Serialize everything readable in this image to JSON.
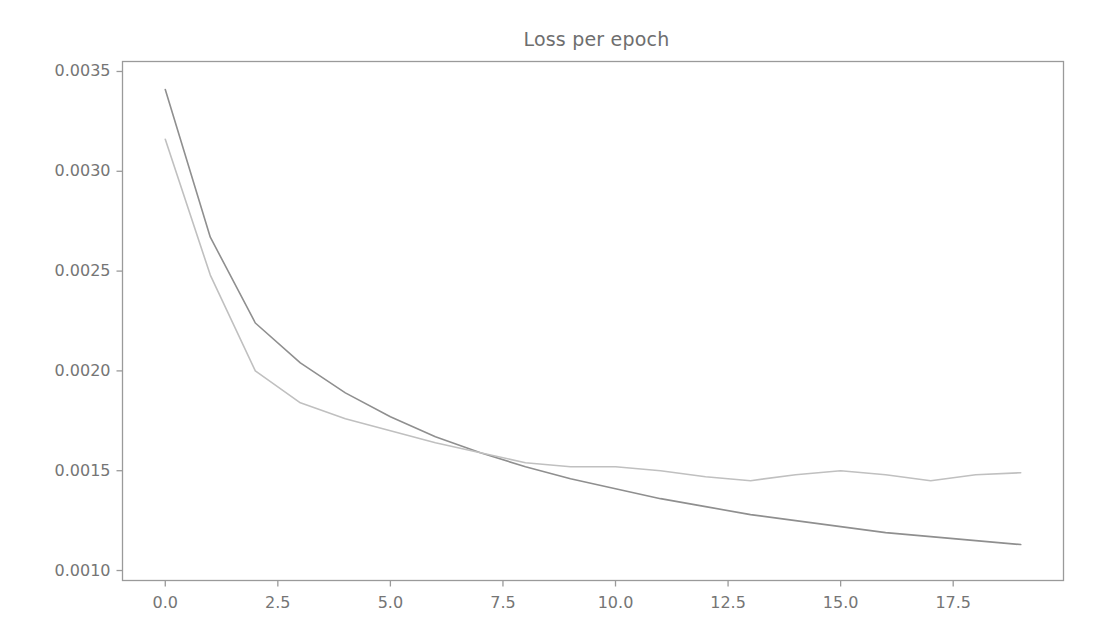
{
  "figure": {
    "title": "Loss per epoch",
    "background": "#ffffff",
    "width": 1103,
    "height": 644
  },
  "axes": {
    "frame_color": "#9a9a9a",
    "tick_color": "#9a9a9a",
    "label_color": "#757575",
    "y_ticks": [
      "0.0035",
      "0.0030",
      "0.0025",
      "0.0020",
      "0.0015",
      "0.0010"
    ],
    "x_ticks": [
      "0.0",
      "2.5",
      "5.0",
      "7.5",
      "10.0",
      "12.5",
      "15.0",
      "17.5"
    ]
  },
  "chart_data": {
    "type": "line",
    "title": "Loss per epoch",
    "xlabel": "",
    "ylabel": "",
    "xlim": [
      -0.95,
      19.95
    ],
    "ylim": [
      0.00095,
      0.00355
    ],
    "grid": false,
    "legend": "none",
    "x": [
      0,
      1,
      2,
      3,
      4,
      5,
      6,
      7,
      8,
      9,
      10,
      11,
      12,
      13,
      14,
      15,
      16,
      17,
      18,
      19
    ],
    "series": [
      {
        "name": "train-loss",
        "color": "#8f8f8f",
        "values": [
          0.00341,
          0.00267,
          0.00224,
          0.00204,
          0.00189,
          0.00177,
          0.00167,
          0.00159,
          0.00152,
          0.00146,
          0.00141,
          0.00136,
          0.00132,
          0.00128,
          0.00125,
          0.00122,
          0.00119,
          0.00117,
          0.00115,
          0.00113
        ]
      },
      {
        "name": "validation-loss",
        "color": "#c0c0c0",
        "values": [
          0.00316,
          0.00248,
          0.002,
          0.00184,
          0.00176,
          0.0017,
          0.00164,
          0.00159,
          0.00154,
          0.00152,
          0.00152,
          0.0015,
          0.00147,
          0.00145,
          0.00148,
          0.0015,
          0.00148,
          0.00145,
          0.00148,
          0.00149
        ]
      }
    ]
  }
}
